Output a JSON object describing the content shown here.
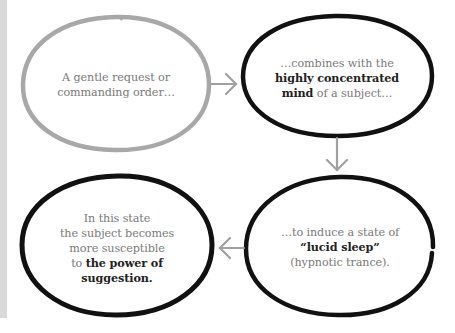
{
  "colors": {
    "gray_outline": "#a8a8a8",
    "black_outline": "#111111",
    "arrow": "#a0a0a0",
    "text_regular": "#7a7a7a",
    "text_bold": "#222222",
    "side_strip": "#d9d9d9"
  },
  "nodes": [
    {
      "id": "step-1",
      "outline": "gray",
      "lines": [
        {
          "pre": "A gentle request or",
          "bold": "",
          "post": ""
        },
        {
          "pre": "commanding order…",
          "bold": "",
          "post": ""
        }
      ]
    },
    {
      "id": "step-2",
      "outline": "black",
      "lines": [
        {
          "pre": "…combines with the",
          "bold": "",
          "post": ""
        },
        {
          "pre": "",
          "bold": "highly concentrated",
          "post": ""
        },
        {
          "pre": "",
          "bold": "mind",
          "post": " of a subject…"
        }
      ]
    },
    {
      "id": "step-3",
      "outline": "black",
      "lines": [
        {
          "pre": "…to induce a state of",
          "bold": "",
          "post": ""
        },
        {
          "pre": "",
          "bold": "“lucid sleep”",
          "post": ""
        },
        {
          "pre": "(hypnotic trance).",
          "bold": "",
          "post": ""
        }
      ]
    },
    {
      "id": "step-4",
      "outline": "black",
      "lines": [
        {
          "pre": "In this state",
          "bold": "",
          "post": ""
        },
        {
          "pre": "the subject becomes",
          "bold": "",
          "post": ""
        },
        {
          "pre": "more susceptible",
          "bold": "",
          "post": ""
        },
        {
          "pre": "to ",
          "bold": "the power of",
          "post": ""
        },
        {
          "pre": "",
          "bold": "suggestion.",
          "post": ""
        }
      ]
    }
  ],
  "arrows": [
    {
      "from": "step-1",
      "to": "step-2",
      "direction": "right"
    },
    {
      "from": "step-2",
      "to": "step-3",
      "direction": "down"
    },
    {
      "from": "step-3",
      "to": "step-4",
      "direction": "left"
    }
  ]
}
